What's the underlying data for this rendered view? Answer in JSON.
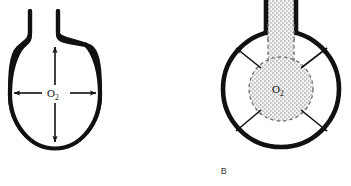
{
  "figure": {
    "background_color": "#ffffff",
    "stroke_color": "#111111",
    "gas_fill_color": "#c9c9c9",
    "dashed_outline_color": "#6e6e6e",
    "width": 351,
    "height": 186,
    "caption_letters": {
      "panel_a": "",
      "panel_b": "B"
    },
    "panels": [
      {
        "id": "panel-a",
        "letter": "",
        "label": "O",
        "label_subscript": "2",
        "description_state": "empty flask with open neck, oxygen expanding outward",
        "arrow_count": 4,
        "arrow_directions": [
          "up",
          "down",
          "left",
          "right"
        ],
        "neck_filled": false,
        "bulb_filled": false,
        "vessel_shape": "round-bottom flask",
        "center_x": 55,
        "center_y": 94,
        "radius_x": 45,
        "radius_y": 57
      },
      {
        "id": "panel-b",
        "letter": "B",
        "label": "O",
        "label_subscript": "2",
        "description_state": "flask with stippled gas column in neck and gas bulb at center diffusing outward",
        "arrow_count": 4,
        "arrow_directions": [
          "up-left",
          "up-right",
          "down-left",
          "down-right"
        ],
        "neck_filled": true,
        "bulb_filled": true,
        "vessel_shape": "round-bottom flask",
        "center_x": 281,
        "center_y": 89,
        "radius_x": 59,
        "radius_y": 59
      }
    ]
  }
}
